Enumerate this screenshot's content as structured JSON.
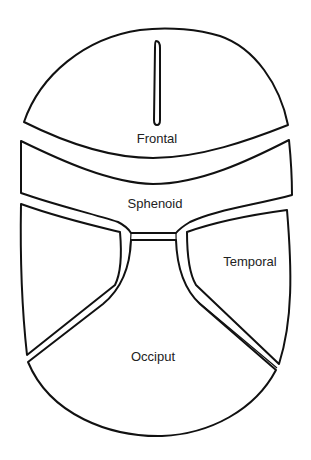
{
  "diagram": {
    "type": "skull-bone-regions",
    "regions": {
      "frontal": {
        "label": "Frontal"
      },
      "sphenoid": {
        "label": "Sphenoid"
      },
      "temporal": {
        "label": "Temporal"
      },
      "occiput": {
        "label": "Occiput"
      }
    },
    "colors": {
      "line": "#111111",
      "background": "#ffffff",
      "text": "#222222"
    }
  }
}
